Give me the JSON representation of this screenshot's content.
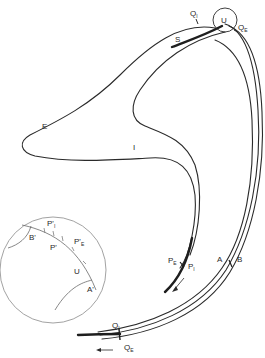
{
  "figure": {
    "type": "trajectory-diagram",
    "labels": {
      "Q_I_top": {
        "main": "Q",
        "sub": "I"
      },
      "U_top": "U",
      "Q_E_top": {
        "main": "Q",
        "sub": "E"
      },
      "S": "S",
      "E": "E",
      "I": "I",
      "P_E": {
        "main": "P",
        "sub": "E"
      },
      "P_I": {
        "main": "P",
        "sub": "I"
      },
      "A": "A",
      "B": "B",
      "Q_I_bottom": {
        "main": "Q",
        "sub": "I"
      },
      "Q_E_bottom": {
        "main": "Q",
        "sub": "E"
      }
    },
    "inset": {
      "labels": {
        "B_prime": "B'",
        "P_I_prime": {
          "main": "P'",
          "sub": "I"
        },
        "P_prime": "P'",
        "P_E_prime": {
          "main": "P'",
          "sub": "E"
        },
        "U": "U",
        "A_prime": "A'"
      }
    },
    "colors": {
      "line": "#2a2a2a",
      "background": "#ffffff"
    }
  }
}
